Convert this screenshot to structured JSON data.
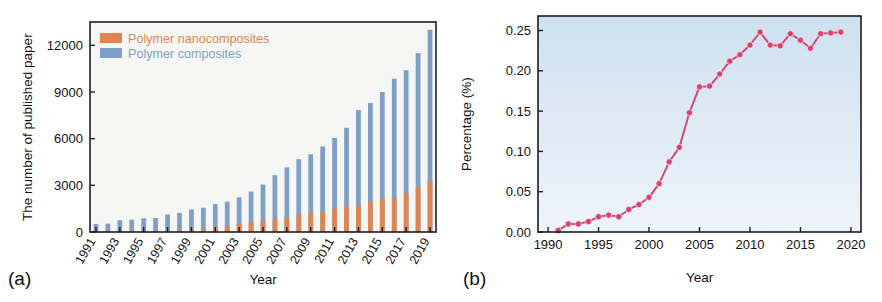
{
  "figure": {
    "panel_a_tag": "(a)",
    "panel_b_tag": "(b)"
  },
  "panel_a": {
    "ylabel": "The number of published paper",
    "xlabel": "Year",
    "legend": [
      {
        "label": "Polymer nanocomposites",
        "color": "#e08552"
      },
      {
        "label": "Polymer composites",
        "color": "#7f9fc8"
      }
    ],
    "ytick_labels": [
      "0",
      "3000",
      "6000",
      "9000",
      "12000"
    ],
    "xtick_labels": [
      "1991",
      "1993",
      "1995",
      "1997",
      "1999",
      "2001",
      "2003",
      "2005",
      "2007",
      "2009",
      "2011",
      "2013",
      "2015",
      "2017",
      "2019"
    ]
  },
  "panel_b": {
    "ylabel": "Percentage (%)",
    "xlabel": "Year",
    "ytick_labels": [
      "0.00",
      "0.05",
      "0.10",
      "0.15",
      "0.20",
      "0.25"
    ],
    "xtick_labels": [
      "1990",
      "1995",
      "2000",
      "2005",
      "2010",
      "2015",
      "2020"
    ],
    "line_color": "#d6436e",
    "plot_bg_top": "#cfe0ef",
    "plot_bg_bottom": "#eef4fa"
  },
  "chart_data": [
    {
      "type": "bar",
      "title": "",
      "panel": "(a)",
      "xlabel": "Year",
      "ylabel": "The number of published paper",
      "ylim": [
        0,
        13500
      ],
      "yticks": [
        0,
        3000,
        6000,
        9000,
        12000
      ],
      "grid": false,
      "legend_position": "top-left",
      "categories": [
        1991,
        1992,
        1993,
        1994,
        1995,
        1996,
        1997,
        1998,
        1999,
        2000,
        2001,
        2002,
        2003,
        2004,
        2005,
        2006,
        2007,
        2008,
        2009,
        2010,
        2011,
        2012,
        2013,
        2014,
        2015,
        2016,
        2017,
        2018,
        2019
      ],
      "series": [
        {
          "name": "Polymer composites",
          "color": "#7f9fc8",
          "values": [
            520,
            540,
            760,
            790,
            880,
            900,
            1130,
            1230,
            1450,
            1560,
            1800,
            1950,
            2230,
            2600,
            3050,
            3650,
            4150,
            4680,
            5000,
            5500,
            6050,
            6700,
            7850,
            8300,
            9000,
            9850,
            10400,
            11500,
            13000
          ]
        },
        {
          "name": "Polymer nanocomposites",
          "color": "#e08552",
          "values": [
            10,
            15,
            20,
            30,
            45,
            60,
            80,
            110,
            150,
            230,
            300,
            400,
            520,
            620,
            700,
            800,
            920,
            1110,
            1250,
            1300,
            1500,
            1620,
            1700,
            1950,
            2100,
            2200,
            2500,
            2900,
            3300
          ]
        }
      ]
    },
    {
      "type": "line",
      "title": "",
      "panel": "(b)",
      "xlabel": "Year",
      "ylabel": "Percentage (%)",
      "xlim": [
        1989,
        2021
      ],
      "ylim": [
        0.0,
        0.268
      ],
      "xticks": [
        1990,
        1995,
        2000,
        2005,
        2010,
        2015,
        2020
      ],
      "yticks": [
        0.0,
        0.05,
        0.1,
        0.15,
        0.2,
        0.25
      ],
      "grid": false,
      "marker": "filled-circle",
      "series": [
        {
          "name": "Percentage",
          "color": "#d6436e",
          "x": [
            1991,
            1992,
            1993,
            1994,
            1995,
            1996,
            1997,
            1998,
            1999,
            2000,
            2001,
            2002,
            2003,
            2004,
            2005,
            2006,
            2007,
            2008,
            2009,
            2010,
            2011,
            2012,
            2013,
            2014,
            2015,
            2016,
            2017,
            2018,
            2019
          ],
          "y": [
            0.002,
            0.01,
            0.01,
            0.013,
            0.019,
            0.021,
            0.019,
            0.028,
            0.034,
            0.043,
            0.06,
            0.087,
            0.105,
            0.148,
            0.18,
            0.181,
            0.196,
            0.212,
            0.22,
            0.232,
            0.248,
            0.232,
            0.231,
            0.246,
            0.238,
            0.228,
            0.246,
            0.247,
            0.248
          ]
        }
      ]
    }
  ]
}
